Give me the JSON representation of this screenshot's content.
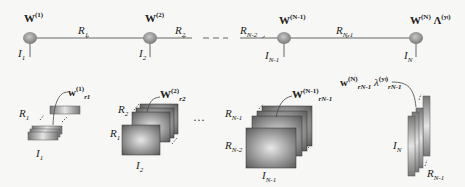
{
  "diagram": {
    "type": "tensor-train-network",
    "top_chain": {
      "nodes": [
        {
          "core": "W",
          "sup": "(1)",
          "index": "I",
          "index_sub": "1"
        },
        {
          "core": "W",
          "sup": "(2)",
          "index": "I",
          "index_sub": "2"
        },
        {
          "core": "W",
          "sup": "(N-1)",
          "index": "I",
          "index_sub": "N-1"
        },
        {
          "core": "W",
          "sup": "(N)",
          "extra": "Λ",
          "extra_sup": "(yₗ)",
          "index": "I",
          "index_sub": "N"
        }
      ],
      "edges": [
        {
          "label": "R",
          "sub": "1"
        },
        {
          "label": "R",
          "sub": "2"
        },
        {
          "label": "R",
          "sub": "N-2"
        },
        {
          "label": "R",
          "sub": "N-1"
        }
      ],
      "ellipsis": "- - -"
    },
    "bottom_tensors": [
      {
        "name": "w",
        "sup": "(1)",
        "sub": "r",
        "subsub": "1",
        "dims": [
          {
            "l": "R",
            "s": "1"
          },
          {
            "l": "I",
            "s": "1"
          }
        ]
      },
      {
        "name": "W",
        "sup": "(2)",
        "sub": "r",
        "subsub": "2",
        "dims": [
          {
            "l": "R",
            "s": "2"
          },
          {
            "l": "R",
            "s": "1"
          },
          {
            "l": "I",
            "s": "2"
          }
        ]
      },
      {
        "name": "W",
        "sup": "(N-1)",
        "sub": "r",
        "subsub": "N-1",
        "dims": [
          {
            "l": "R",
            "s": "N-1"
          },
          {
            "l": "R",
            "s": "N-2"
          },
          {
            "l": "I",
            "s": "N-1"
          }
        ]
      },
      {
        "name": "w",
        "sup": "(N)",
        "sub": "r",
        "subsub": "N-1",
        "extra": "λ",
        "extra_sup": "(yₗ)",
        "extra_sub": "r",
        "extra_subsub": "N-1",
        "dims": [
          {
            "l": "I",
            "s": "N"
          },
          {
            "l": "R",
            "s": "N-1"
          }
        ]
      }
    ],
    "mid_ellipsis": "···"
  }
}
